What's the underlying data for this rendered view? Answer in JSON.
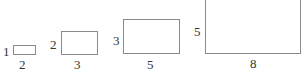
{
  "diagram": {
    "rectangles": [
      {
        "height_label": "1",
        "width_label": "2"
      },
      {
        "height_label": "2",
        "width_label": "3"
      },
      {
        "height_label": "3",
        "width_label": "5"
      },
      {
        "height_label": "5",
        "width_label": "8"
      }
    ]
  }
}
